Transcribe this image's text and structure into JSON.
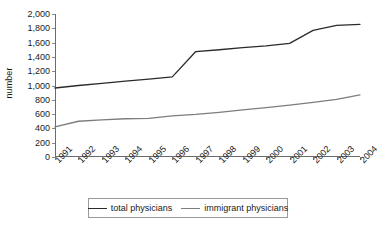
{
  "chart_data": {
    "type": "line",
    "title": "",
    "xlabel": "",
    "ylabel": "number",
    "categories": [
      "1991",
      "1992",
      "1993",
      "1994",
      "1995",
      "1996",
      "1997",
      "1998",
      "1999",
      "2000",
      "2001",
      "2002",
      "2003",
      "2004"
    ],
    "series": [
      {
        "name": "total physicians",
        "color": "#2b2b2b",
        "values": [
          965,
          1000,
          1030,
          1060,
          1090,
          1120,
          1475,
          1500,
          1530,
          1555,
          1590,
          1770,
          1840,
          1855
        ]
      },
      {
        "name": "immigrant physicians",
        "color": "#7d7d7d",
        "values": [
          420,
          500,
          520,
          535,
          540,
          575,
          595,
          625,
          660,
          690,
          725,
          765,
          805,
          870
        ]
      }
    ],
    "ylim": [
      0,
      2000
    ],
    "ytick_step": 200,
    "yticks": [
      0,
      200,
      400,
      600,
      800,
      1000,
      1200,
      1400,
      1600,
      1800,
      2000
    ],
    "ytick_labels": [
      "0",
      "200",
      "400",
      "600",
      "800",
      "1,000",
      "1,200",
      "1,400",
      "1,600",
      "1,800",
      "2,000"
    ],
    "grid": false,
    "legend_position": "bottom",
    "xtick_rotation": -45
  },
  "axis": {
    "y_title": "number"
  },
  "legend": {
    "entries": [
      {
        "label": "total physicians",
        "color": "#2b2b2b"
      },
      {
        "label": "immigrant physicians",
        "color": "#7d7d7d"
      }
    ]
  }
}
